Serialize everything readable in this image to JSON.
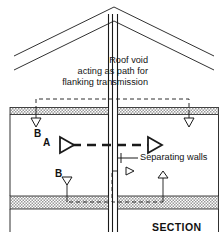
{
  "figure": {
    "title": "SECTION",
    "type": "architectural-section",
    "background_color": "#ffffff",
    "line_color": "#1a1a1a",
    "hatch_color": "#8c8c8c"
  },
  "labels": {
    "roof_void": "Roof void\nacting as path for\nflanking transmission",
    "roof_void_line1": "Roof void",
    "roof_void_line2": "acting as path for",
    "roof_void_line3": "flanking transmission",
    "separating_walls": "Separating walls",
    "section": "SECTION",
    "path_a": "A",
    "path_b_upper": "B",
    "path_b_lower": "B"
  },
  "elements": {
    "roof": "gable-roof",
    "separating_wall": "central-vertical-cavity-wall",
    "upper_floor": "hatched-ceiling-slab",
    "lower_floor": "hatched-floor-slab",
    "direct_path": "A",
    "flanking_paths": "B"
  }
}
